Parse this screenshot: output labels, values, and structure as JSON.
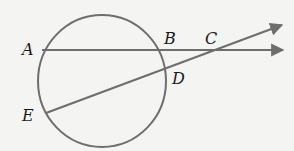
{
  "diagram": {
    "type": "circle-secants",
    "colors": {
      "stroke": "#6e6e6e",
      "label": "#1a1a1a",
      "background": "#f4f4f2"
    },
    "circle": {
      "cx": 102,
      "cy": 81,
      "rx": 64,
      "ry": 66
    },
    "points": {
      "A": {
        "label": "A",
        "x": 42,
        "y": 50
      },
      "B": {
        "label": "B",
        "x": 161,
        "y": 50
      },
      "C": {
        "label": "C",
        "x": 213,
        "y": 50
      },
      "D": {
        "label": "D",
        "x": 167,
        "y": 68
      },
      "E": {
        "label": "E",
        "x": 48,
        "y": 112
      }
    },
    "rays": [
      {
        "name": "ray-AB",
        "from": "A",
        "through": "B",
        "to": [
          284,
          50
        ]
      },
      {
        "name": "ray-ED",
        "from": "E",
        "through": "D",
        "to": [
          283,
          25
        ]
      }
    ]
  }
}
